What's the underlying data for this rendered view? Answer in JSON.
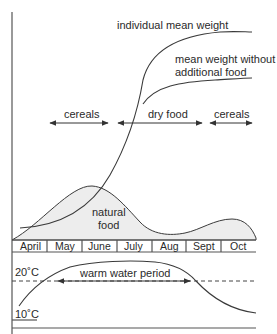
{
  "diagram": {
    "curves": {
      "individual_mean_weight": "individual mean weight",
      "weight_without_food_line1": "mean weight without",
      "weight_without_food_line2": "additional food",
      "natural_food_line1": "natural",
      "natural_food_line2": "food"
    },
    "feeding_periods": [
      {
        "label": "cereals"
      },
      {
        "label": "dry food"
      },
      {
        "label": "cereals"
      }
    ],
    "months": [
      "April",
      "May",
      "June",
      "July",
      "Aug",
      "Sept",
      "Oct"
    ],
    "temperature": {
      "high_label": "20˚C",
      "low_label": "10˚C",
      "warm_period_label": "warm water period"
    },
    "colors": {
      "line": "#3a3a3a",
      "fill": "#ededed",
      "background": "#ffffff"
    }
  }
}
